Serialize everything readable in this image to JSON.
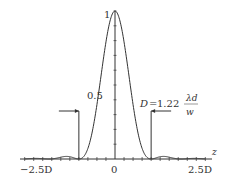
{
  "chart_data": {
    "type": "line",
    "title": "",
    "function": "Airy pattern intensity I(z) = [2 J1(x)/x]^2, first zero at z = D",
    "xlabel": "z",
    "ylabel": "",
    "x_tick_labels": [
      "−2.5D",
      "0",
      "2.5D"
    ],
    "x_ticks_D": [
      -2.5,
      0,
      2.5
    ],
    "y_tick_labels": [
      "0.5",
      "1"
    ],
    "y_ticks": [
      0.5,
      1
    ],
    "xlim_D": [
      -2.5,
      2.5
    ],
    "ylim": [
      0,
      1
    ],
    "annotation": {
      "lhs": "D",
      "eq": "=",
      "coef": "1.22",
      "num": "λd",
      "den": "w"
    },
    "markers_D": [
      -1,
      1
    ],
    "grid": false
  }
}
